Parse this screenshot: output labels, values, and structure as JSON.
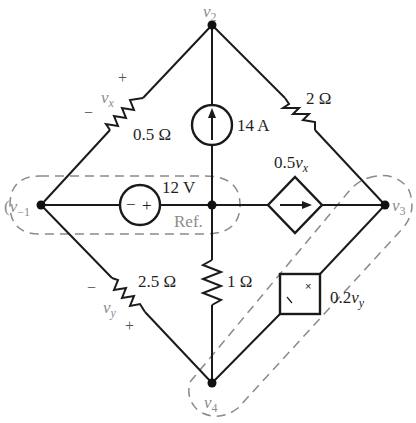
{
  "diagram": {
    "type": "electrical-circuit",
    "nodes": {
      "v2": {
        "label": "v",
        "sub": "2"
      },
      "v_minus1": {
        "label": "v",
        "sub": "−1"
      },
      "ref": {
        "label": "Ref."
      },
      "v3": {
        "label": "v",
        "sub": "3"
      },
      "v4": {
        "label": "v",
        "sub": "4"
      }
    },
    "components": {
      "r_05": {
        "value": "0.5 Ω",
        "voltage_var": "v",
        "voltage_sub": "x",
        "plus": "+",
        "minus": "−"
      },
      "r_2": {
        "value": "2 Ω"
      },
      "i_14": {
        "value": "14 A"
      },
      "v_12": {
        "value": "12 V",
        "minus": "−",
        "plus": "+"
      },
      "dep_i": {
        "coef": "0.5",
        "var": "v",
        "sub": "x"
      },
      "r_25": {
        "value": "2.5 Ω",
        "voltage_var": "v",
        "voltage_sub": "y",
        "plus": "+",
        "minus": "−"
      },
      "r_1": {
        "value": "1 Ω"
      },
      "dep_v": {
        "coef": "0.2",
        "var": "v",
        "sub": "y",
        "plus": "×",
        "minus": "∖"
      }
    },
    "supernodes": [
      "v_minus1-ref",
      "v3-v4"
    ],
    "colors": {
      "wire": "#1a1a1a",
      "dashed": "#8a8a8a",
      "grey_label": "#8c8c8c"
    }
  }
}
